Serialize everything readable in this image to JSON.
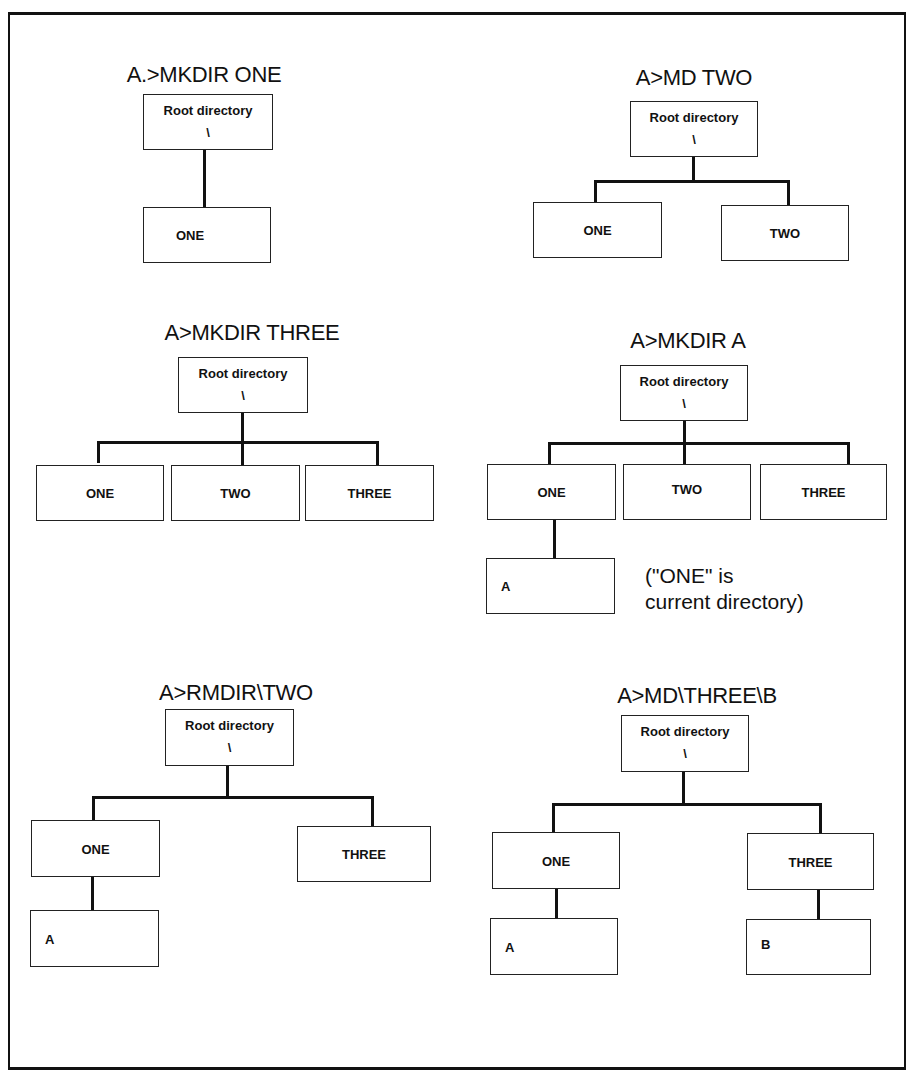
{
  "diagrams": [
    {
      "command": "A.>MKDIR ONE",
      "root": {
        "label": "Root directory",
        "symbol": "\\"
      },
      "children": [
        {
          "label": "ONE"
        }
      ]
    },
    {
      "command": "A>MD TWO",
      "root": {
        "label": "Root directory",
        "symbol": "\\"
      },
      "children": [
        {
          "label": "ONE"
        },
        {
          "label": "TWO"
        }
      ]
    },
    {
      "command": "A>MKDIR THREE",
      "root": {
        "label": "Root directory",
        "symbol": "\\"
      },
      "children": [
        {
          "label": "ONE"
        },
        {
          "label": "TWO"
        },
        {
          "label": "THREE"
        }
      ]
    },
    {
      "command": "A>MKDIR A",
      "root": {
        "label": "Root directory",
        "symbol": "\\"
      },
      "children": [
        {
          "label": "ONE",
          "children": [
            {
              "label": "A"
            }
          ]
        },
        {
          "label": "TWO"
        },
        {
          "label": "THREE"
        }
      ],
      "note_line1": "(\"ONE\" is",
      "note_line2": "current directory)"
    },
    {
      "command": "A>RMDIR\\TWO",
      "root": {
        "label": "Root directory",
        "symbol": "\\"
      },
      "children": [
        {
          "label": "ONE",
          "children": [
            {
              "label": "A"
            }
          ]
        },
        {
          "label": "THREE"
        }
      ]
    },
    {
      "command": "A>MD\\THREE\\B",
      "root": {
        "label": "Root directory",
        "symbol": "\\"
      },
      "children": [
        {
          "label": "ONE",
          "children": [
            {
              "label": "A"
            }
          ]
        },
        {
          "label": "THREE",
          "children": [
            {
              "label": "B"
            }
          ]
        }
      ]
    }
  ]
}
